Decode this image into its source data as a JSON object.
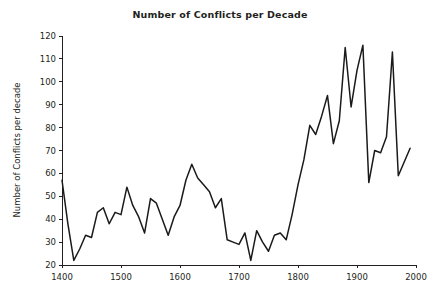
{
  "chart_data": {
    "type": "line",
    "title": "Number of Conflicts per Decade",
    "xlabel": "",
    "ylabel": "Number of Conflicts per decade",
    "xlim": [
      1400,
      2000
    ],
    "ylim": [
      20,
      120
    ],
    "grid": false,
    "legend": null,
    "x_ticks": [
      1400,
      1500,
      1600,
      1700,
      1800,
      1900,
      2000
    ],
    "x_tick_labels": [
      "1400",
      "1500",
      "1600",
      "1700",
      "1800",
      "1900",
      "2000"
    ],
    "y_ticks": [
      20,
      30,
      40,
      50,
      60,
      70,
      80,
      90,
      100,
      110,
      120
    ],
    "y_tick_labels": [
      "20",
      "30",
      "40",
      "50",
      "60",
      "70",
      "80",
      "90",
      "100",
      "110",
      "120"
    ],
    "line_color": "#1a1a1a",
    "series": [
      {
        "name": "Conflicts per decade",
        "x": [
          1400,
          1410,
          1420,
          1430,
          1440,
          1450,
          1460,
          1470,
          1480,
          1490,
          1500,
          1510,
          1520,
          1530,
          1540,
          1550,
          1560,
          1570,
          1580,
          1590,
          1600,
          1610,
          1620,
          1630,
          1640,
          1650,
          1660,
          1670,
          1680,
          1690,
          1700,
          1710,
          1720,
          1730,
          1740,
          1750,
          1760,
          1770,
          1780,
          1790,
          1800,
          1810,
          1820,
          1830,
          1840,
          1850,
          1860,
          1870,
          1880,
          1890,
          1900,
          1910,
          1920,
          1930,
          1940,
          1950,
          1960,
          1970,
          1980,
          1990
        ],
        "values": [
          57,
          38,
          22,
          27,
          33,
          32,
          43,
          45,
          38,
          43,
          42,
          54,
          46,
          41,
          34,
          49,
          47,
          40,
          33,
          41,
          46,
          57,
          64,
          58,
          55,
          52,
          45,
          49,
          31,
          30,
          29,
          34,
          22,
          35,
          30,
          26,
          33,
          34,
          31,
          42,
          55,
          66,
          81,
          77,
          85,
          94,
          73,
          83,
          115,
          89,
          105,
          116,
          56,
          70,
          69,
          76,
          113,
          59,
          65,
          71
        ]
      }
    ]
  },
  "axes": {
    "title": "Number of Conflicts per Decade",
    "ylabel": "Number of Conflicts per decade"
  }
}
